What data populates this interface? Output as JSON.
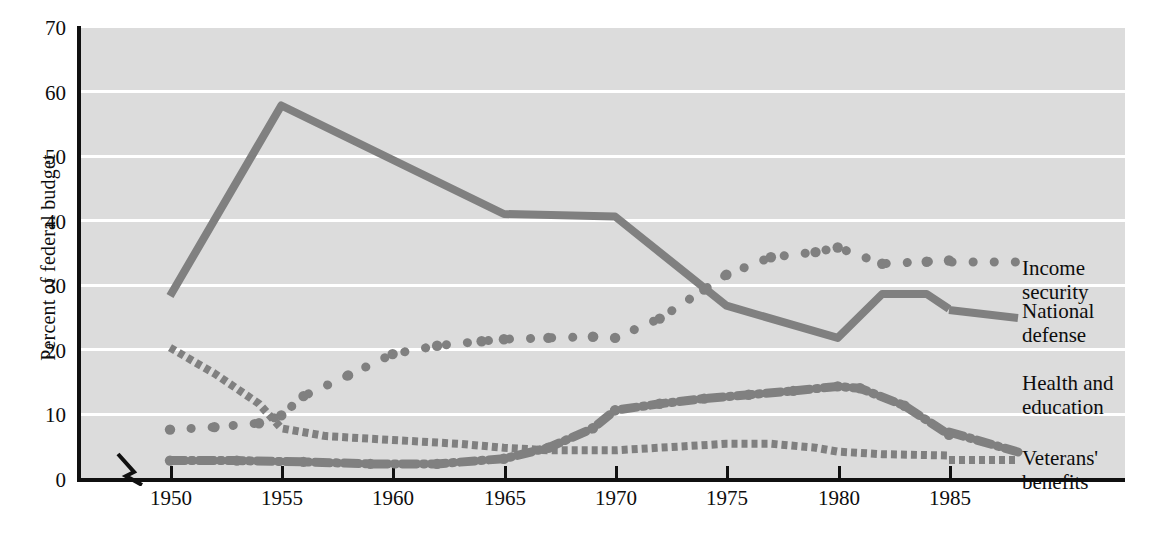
{
  "chart_data": {
    "type": "line",
    "title": "",
    "xlabel": "",
    "ylabel": "Percent of federal budget",
    "xlim": [
      1948,
      1987
    ],
    "ylim": [
      0,
      70
    ],
    "ytick_labels": [
      "70",
      "60",
      "50",
      "40",
      "30",
      "20",
      "10",
      "0"
    ],
    "ytick_values": [
      70,
      60,
      50,
      40,
      30,
      20,
      10,
      0
    ],
    "xtick_labels": [
      "1950",
      "1955",
      "1960",
      "1965",
      "1970",
      "1975",
      "1980",
      "1985"
    ],
    "xtick_values": [
      1950,
      1955,
      1960,
      1965,
      1970,
      1975,
      1980,
      1985
    ],
    "grid": "horizontal",
    "axis_break_x": true,
    "legend_position": "right-inline",
    "plot_background": "#dcdcdc",
    "gridline_color": "#ffffff",
    "series_color": "#808080",
    "axis_color": "#101010",
    "series": [
      {
        "name": "National defense",
        "style": "solid",
        "x": [
          1950,
          1955,
          1965,
          1970,
          1975,
          1980,
          1982,
          1984,
          1985
        ],
        "values": [
          28.5,
          58.0,
          41.2,
          40.8,
          27.0,
          22.0,
          28.8,
          28.8,
          26.5
        ]
      },
      {
        "name": "Income security",
        "style": "dotted",
        "x": [
          1950,
          1952,
          1954,
          1955,
          1956,
          1958,
          1960,
          1962,
          1964,
          1965,
          1967,
          1969,
          1970,
          1972,
          1974,
          1975,
          1977,
          1979,
          1980,
          1982,
          1984,
          1985
        ],
        "values": [
          7.8,
          8.2,
          8.8,
          10.0,
          13.0,
          16.2,
          19.5,
          20.8,
          21.5,
          21.8,
          22.0,
          22.2,
          22.0,
          25.0,
          29.5,
          31.8,
          34.5,
          35.3,
          36.0,
          33.5,
          33.8,
          34.0
        ]
      },
      {
        "name": "Health and education",
        "style": "dash-dot",
        "x": [
          1950,
          1953,
          1956,
          1959,
          1962,
          1965,
          1967,
          1969,
          1970,
          1972,
          1974,
          1976,
          1978,
          1980,
          1981,
          1983,
          1985
        ],
        "values": [
          3.0,
          3.0,
          2.8,
          2.5,
          2.5,
          3.3,
          5.0,
          8.0,
          10.8,
          11.8,
          12.6,
          13.2,
          13.8,
          14.5,
          14.2,
          11.5,
          7.0
        ]
      },
      {
        "name": "Veterans' benefits",
        "style": "fine-dotted",
        "x": [
          1950,
          1952,
          1954,
          1955,
          1957,
          1960,
          1963,
          1965,
          1967,
          1970,
          1973,
          1975,
          1977,
          1979,
          1980,
          1982,
          1985
        ],
        "values": [
          20.5,
          16.5,
          11.8,
          8.0,
          6.8,
          6.2,
          5.6,
          5.0,
          4.6,
          4.6,
          5.2,
          5.6,
          5.6,
          5.0,
          4.4,
          4.0,
          3.8
        ]
      }
    ]
  },
  "legend": [
    {
      "label": "Income security"
    },
    {
      "label": "National defense"
    },
    {
      "label": "Health and\neducation"
    },
    {
      "label": "Veterans' benefits"
    }
  ]
}
